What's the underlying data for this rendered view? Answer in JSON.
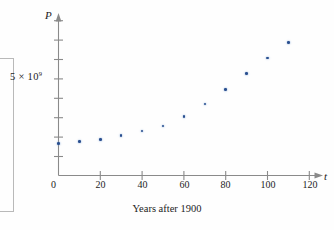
{
  "figure": {
    "y_axis_name": "P",
    "x_axis_name": "t",
    "x_axis_title": "Years after 1900",
    "origin_label": "0",
    "y_tick_label_mantissa": "5 × 10",
    "y_tick_label_exponent": "9",
    "dot_color": "#2a4f8f",
    "axis_color": "#8a8a8a"
  },
  "chart_data": {
    "type": "scatter",
    "title": "",
    "subtitle": "",
    "xlabel": "Years after 1900",
    "ylabel": "P",
    "xlim": [
      0,
      130
    ],
    "ylim": [
      0,
      9500000000
    ],
    "grid": false,
    "legend": null,
    "x_ticks": [
      20,
      40,
      60,
      80,
      100,
      120
    ],
    "x_tick_labels": [
      "20",
      "40",
      "60",
      "80",
      "100",
      "120"
    ],
    "y_ticks": [
      1000000000,
      2000000000,
      3000000000,
      4000000000,
      5000000000,
      6000000000,
      7000000000,
      8000000000,
      9000000000
    ],
    "y_tick_labels": [
      "",
      "",
      "",
      "",
      "5 × 10⁹",
      "",
      "",
      "",
      ""
    ],
    "x": [
      0,
      10,
      20,
      30,
      40,
      50,
      60,
      70,
      80,
      90,
      100,
      110
    ],
    "y": [
      1650000000,
      1750000000,
      1860000000,
      2070000000,
      2300000000,
      2560000000,
      3040000000,
      3710000000,
      4450000000,
      5280000000,
      6080000000,
      6870000000
    ],
    "point_labels": [
      "1900, 1650 million",
      "1910, 1750 million",
      "1920, 1860 million",
      "1930, 2070 million",
      "1940, 2300 million",
      "1950, 2560 million",
      "1960, 3040 million",
      "1970, 3710 million",
      "1980, 4450 million",
      "1990, 5280 million",
      "2000, 6080 million",
      "2010, 6870 million"
    ],
    "annotations": []
  }
}
